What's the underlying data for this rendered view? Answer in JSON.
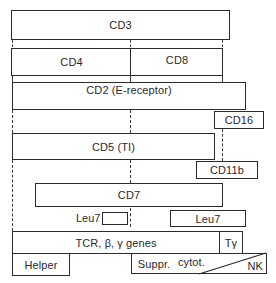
{
  "diagram": {
    "type": "T-cell surface marker / lineage diagram",
    "markers": {
      "cd3": "CD3",
      "cd4": "CD4",
      "cd8": "CD8",
      "cd2": "CD2 (E-receptor)",
      "cd16": "CD16",
      "cd5": "CD5 (TI)",
      "cd11b": "CD11b",
      "cd7": "CD7",
      "leu7_left": "Leu7",
      "leu7_right": "Leu7",
      "tcr": "TCR, β, γ genes",
      "tgamma": "Tγ"
    },
    "subsets": {
      "helper": "Helper",
      "suppr": "Suppr.",
      "cytot": "cytot.",
      "nk": "NK"
    }
  }
}
